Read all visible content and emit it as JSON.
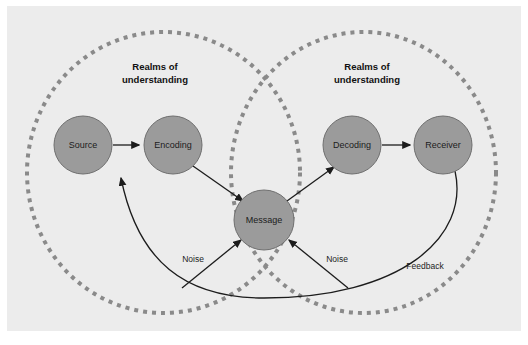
{
  "figure": {
    "background_color": "#ffffff",
    "panel_color": "#ececec",
    "node_fill": "#9b9b9b",
    "node_stroke": "#6f6f6f",
    "line_color": "#1c1c1c",
    "ellipse_color": "#8a8a8a"
  },
  "realms": [
    {
      "id": "realm-left",
      "line1": "Realms of",
      "line2": "understanding"
    },
    {
      "id": "realm-right",
      "line1": "Realms of",
      "line2": "understanding"
    }
  ],
  "nodes": [
    {
      "id": "source",
      "label": "Source"
    },
    {
      "id": "encoding",
      "label": "Encoding"
    },
    {
      "id": "message",
      "label": "Message"
    },
    {
      "id": "decoding",
      "label": "Decoding"
    },
    {
      "id": "receiver",
      "label": "Receiver"
    }
  ],
  "edge_labels": [
    {
      "id": "noise-left",
      "label": "Noise"
    },
    {
      "id": "noise-right",
      "label": "Noise"
    },
    {
      "id": "feedback",
      "label": "Feedback"
    }
  ]
}
